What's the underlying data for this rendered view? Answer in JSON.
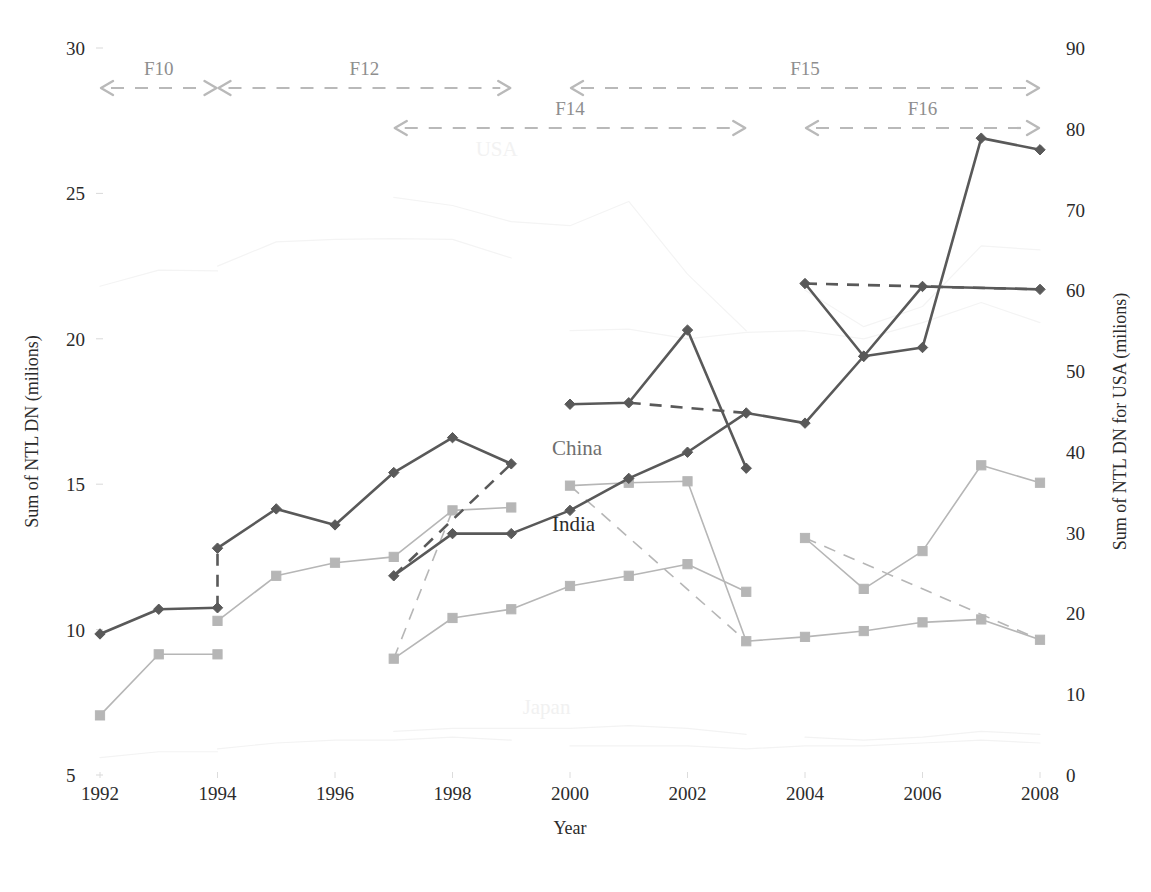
{
  "chart_data": {
    "type": "line",
    "title": "",
    "xlabel": "Year",
    "ylabel_left": "Sum of NTL DN (milions)",
    "ylabel_right": "Sum of NTL DN for USA (milions)",
    "x": [
      1992,
      1993,
      1994,
      1995,
      1996,
      1997,
      1998,
      1999,
      2000,
      2001,
      2002,
      2003,
      2004,
      2005,
      2006,
      2007,
      2008
    ],
    "xticks": [
      "1992",
      "1994",
      "1996",
      "1998",
      "2000",
      "2002",
      "2004",
      "2006",
      "2008"
    ],
    "xtick_values": [
      1992,
      1994,
      1996,
      1998,
      2000,
      2002,
      2004,
      2006,
      2008
    ],
    "ylim_left": [
      5,
      30
    ],
    "yticks_left": [
      "5",
      "10",
      "15",
      "20",
      "25",
      "30"
    ],
    "ytick_values_left": [
      5,
      10,
      15,
      20,
      25,
      30
    ],
    "ylim_right": [
      0,
      90
    ],
    "yticks_right": [
      "0",
      "10",
      "20",
      "30",
      "40",
      "50",
      "60",
      "70",
      "80",
      "90"
    ],
    "ytick_values_right": [
      0,
      10,
      20,
      30,
      40,
      50,
      60,
      70,
      80,
      90
    ],
    "grid": false,
    "legend_position": "inline-annotations",
    "satellite_annotations": [
      {
        "label": "F10",
        "x_start": 1992,
        "x_end": 1994,
        "row": 0
      },
      {
        "label": "F12",
        "x_start": 1994,
        "x_end": 1999,
        "row": 0
      },
      {
        "label": "F14",
        "x_start": 1997,
        "x_end": 2003,
        "row": 1
      },
      {
        "label": "F15",
        "x_start": 2000,
        "x_end": 2008,
        "row": 0
      },
      {
        "label": "F16",
        "x_start": 2004,
        "x_end": 2008,
        "row": 1
      }
    ],
    "inline_labels": [
      {
        "text": "China",
        "x": 2000,
        "y_left": 16.0,
        "style": "china"
      },
      {
        "text": "India",
        "x": 2000,
        "y_left": 13.4,
        "style": "india"
      },
      {
        "text": "USA",
        "x": 1998.7,
        "y_left": 26.3,
        "style": "usa"
      },
      {
        "text": "Japan",
        "x": 1999.5,
        "y_left": 7.1,
        "style": "japan"
      }
    ],
    "series": [
      {
        "name": "China",
        "axis": "left",
        "color": "#595959",
        "marker": "diamond",
        "segments": [
          {
            "satellite": "F10",
            "points": [
              {
                "x": 1992,
                "y": 9.85
              },
              {
                "x": 1993,
                "y": 10.7
              },
              {
                "x": 1994,
                "y": 10.75
              }
            ]
          },
          {
            "satellite": "F12",
            "points": [
              {
                "x": 1994,
                "y": 12.8
              },
              {
                "x": 1995,
                "y": 14.15
              },
              {
                "x": 1996,
                "y": 13.6
              },
              {
                "x": 1997,
                "y": 15.4
              },
              {
                "x": 1998,
                "y": 16.6
              },
              {
                "x": 1999,
                "y": 15.7
              }
            ]
          },
          {
            "satellite": "F14",
            "points": [
              {
                "x": 2000,
                "y": 17.75
              },
              {
                "x": 2001,
                "y": 17.8
              },
              {
                "x": 2002,
                "y": 20.3
              },
              {
                "x": 2003,
                "y": 15.55
              }
            ]
          },
          {
            "satellite": "F15",
            "points": [
              {
                "x": 2000,
                "y": 14.1
              },
              {
                "x": 2001,
                "y": 15.2
              },
              {
                "x": 2002,
                "y": 16.1
              },
              {
                "x": 2003,
                "y": 17.45
              },
              {
                "x": 2004,
                "y": 17.1
              },
              {
                "x": 2005,
                "y": 19.4
              },
              {
                "x": 2006,
                "y": 19.7
              },
              {
                "x": 2007,
                "y": 26.9
              },
              {
                "x": 2008,
                "y": 26.5
              }
            ]
          },
          {
            "satellite": "F16",
            "points": [
              {
                "x": 2004,
                "y": 21.9
              },
              {
                "x": 2005,
                "y": 19.4
              },
              {
                "x": 2006,
                "y": 21.8
              },
              {
                "x": 2008,
                "y": 21.7
              }
            ]
          }
        ],
        "dashed_connectors": [
          {
            "from": {
              "x": 1994,
              "y": 10.75
            },
            "to": {
              "x": 1994,
              "y": 12.8
            }
          },
          {
            "from": {
              "x": 1997,
              "y": 11.85
            },
            "to": {
              "x": 1999,
              "y": 15.7
            }
          },
          {
            "from": {
              "x": 2001,
              "y": 17.8
            },
            "to": {
              "x": 2003,
              "y": 17.45
            }
          },
          {
            "from": {
              "x": 2004,
              "y": 21.9
            },
            "to": {
              "x": 2008,
              "y": 21.7
            }
          }
        ],
        "extra_points": [
          {
            "x": 1997,
            "y": 11.85
          },
          {
            "x": 1998,
            "y": 13.3
          },
          {
            "x": 1999,
            "y": 13.3
          }
        ]
      },
      {
        "name": "India",
        "axis": "left",
        "color": "#b6b6b6",
        "marker": "square",
        "segments": [
          {
            "satellite": "F10",
            "points": [
              {
                "x": 1992,
                "y": 7.05
              },
              {
                "x": 1993,
                "y": 9.15
              },
              {
                "x": 1994,
                "y": 9.15
              }
            ]
          },
          {
            "satellite": "F12",
            "points": [
              {
                "x": 1994,
                "y": 10.3
              },
              {
                "x": 1995,
                "y": 11.85
              },
              {
                "x": 1996,
                "y": 12.3
              },
              {
                "x": 1997,
                "y": 12.5
              },
              {
                "x": 1998,
                "y": 14.1
              },
              {
                "x": 1999,
                "y": 14.2
              }
            ]
          },
          {
            "satellite": "F14",
            "points": [
              {
                "x": 1997,
                "y": 9.0
              },
              {
                "x": 1998,
                "y": 10.4
              },
              {
                "x": 1999,
                "y": 10.7
              },
              {
                "x": 2000,
                "y": 11.5
              },
              {
                "x": 2001,
                "y": 11.85
              },
              {
                "x": 2002,
                "y": 12.25
              },
              {
                "x": 2003,
                "y": 11.3
              }
            ]
          },
          {
            "satellite": "F15",
            "points": [
              {
                "x": 2000,
                "y": 14.95
              },
              {
                "x": 2001,
                "y": 15.05
              },
              {
                "x": 2002,
                "y": 15.1
              },
              {
                "x": 2003,
                "y": 9.6
              },
              {
                "x": 2004,
                "y": 9.75
              },
              {
                "x": 2005,
                "y": 9.95
              },
              {
                "x": 2006,
                "y": 10.25
              },
              {
                "x": 2007,
                "y": 10.35
              },
              {
                "x": 2008,
                "y": 9.65
              }
            ]
          },
          {
            "satellite": "F16",
            "points": [
              {
                "x": 2004,
                "y": 13.15
              },
              {
                "x": 2005,
                "y": 11.4
              },
              {
                "x": 2006,
                "y": 12.7
              },
              {
                "x": 2007,
                "y": 15.65
              },
              {
                "x": 2008,
                "y": 15.05
              }
            ]
          }
        ],
        "dashed_connectors": [
          {
            "from": {
              "x": 1997,
              "y": 9.0
            },
            "to": {
              "x": 1998,
              "y": 14.1
            }
          },
          {
            "from": {
              "x": 2000,
              "y": 14.95
            },
            "to": {
              "x": 2003,
              "y": 9.6
            }
          },
          {
            "from": {
              "x": 2004,
              "y": 13.15
            },
            "to": {
              "x": 2008,
              "y": 9.65
            }
          }
        ],
        "extra_points": []
      },
      {
        "name": "USA",
        "axis": "right",
        "color": "#f4f4f4",
        "marker": "none",
        "segments": [
          {
            "satellite": "F10",
            "points": [
              {
                "x": 1992,
                "y": 60.5
              },
              {
                "x": 1993,
                "y": 62.5
              },
              {
                "x": 1994,
                "y": 62.4
              }
            ]
          },
          {
            "satellite": "F12",
            "points": [
              {
                "x": 1994,
                "y": 63.0
              },
              {
                "x": 1995,
                "y": 66.0
              },
              {
                "x": 1996,
                "y": 66.3
              },
              {
                "x": 1997,
                "y": 66.4
              },
              {
                "x": 1998,
                "y": 66.3
              },
              {
                "x": 1999,
                "y": 64.0
              }
            ]
          },
          {
            "satellite": "F14",
            "points": [
              {
                "x": 1997,
                "y": 71.5
              },
              {
                "x": 1998,
                "y": 70.5
              },
              {
                "x": 1999,
                "y": 68.5
              },
              {
                "x": 2000,
                "y": 68.0
              },
              {
                "x": 2001,
                "y": 71.0
              },
              {
                "x": 2002,
                "y": 62.0
              },
              {
                "x": 2003,
                "y": 55.0
              }
            ]
          },
          {
            "satellite": "F15",
            "points": [
              {
                "x": 2000,
                "y": 55.0
              },
              {
                "x": 2001,
                "y": 55.2
              },
              {
                "x": 2002,
                "y": 54.0
              },
              {
                "x": 2003,
                "y": 54.8
              },
              {
                "x": 2004,
                "y": 55.0
              },
              {
                "x": 2005,
                "y": 54.0
              },
              {
                "x": 2006,
                "y": 56.0
              },
              {
                "x": 2007,
                "y": 58.5
              },
              {
                "x": 2008,
                "y": 56.0
              }
            ]
          },
          {
            "satellite": "F16",
            "points": [
              {
                "x": 2004,
                "y": 60.0
              },
              {
                "x": 2005,
                "y": 55.5
              },
              {
                "x": 2006,
                "y": 58.0
              },
              {
                "x": 2007,
                "y": 65.5
              },
              {
                "x": 2008,
                "y": 65.0
              }
            ]
          }
        ],
        "dashed_connectors": [],
        "extra_points": []
      },
      {
        "name": "Japan",
        "axis": "left",
        "color": "#f3f3f3",
        "marker": "none",
        "segments": [
          {
            "satellite": "F10",
            "points": [
              {
                "x": 1992,
                "y": 5.6
              },
              {
                "x": 1993,
                "y": 5.8
              },
              {
                "x": 1994,
                "y": 5.8
              }
            ]
          },
          {
            "satellite": "F12",
            "points": [
              {
                "x": 1994,
                "y": 5.9
              },
              {
                "x": 1995,
                "y": 6.1
              },
              {
                "x": 1996,
                "y": 6.2
              },
              {
                "x": 1997,
                "y": 6.2
              },
              {
                "x": 1998,
                "y": 6.3
              },
              {
                "x": 1999,
                "y": 6.2
              }
            ]
          },
          {
            "satellite": "F14",
            "points": [
              {
                "x": 1997,
                "y": 6.5
              },
              {
                "x": 1998,
                "y": 6.6
              },
              {
                "x": 1999,
                "y": 6.6
              },
              {
                "x": 2000,
                "y": 6.6
              },
              {
                "x": 2001,
                "y": 6.7
              },
              {
                "x": 2002,
                "y": 6.6
              },
              {
                "x": 2003,
                "y": 6.4
              }
            ]
          },
          {
            "satellite": "F15",
            "points": [
              {
                "x": 2000,
                "y": 6.0
              },
              {
                "x": 2001,
                "y": 6.0
              },
              {
                "x": 2002,
                "y": 6.0
              },
              {
                "x": 2003,
                "y": 5.9
              },
              {
                "x": 2004,
                "y": 6.0
              },
              {
                "x": 2005,
                "y": 6.0
              },
              {
                "x": 2006,
                "y": 6.1
              },
              {
                "x": 2007,
                "y": 6.2
              },
              {
                "x": 2008,
                "y": 6.1
              }
            ]
          },
          {
            "satellite": "F16",
            "points": [
              {
                "x": 2004,
                "y": 6.3
              },
              {
                "x": 2005,
                "y": 6.2
              },
              {
                "x": 2006,
                "y": 6.3
              },
              {
                "x": 2007,
                "y": 6.5
              },
              {
                "x": 2008,
                "y": 6.4
              }
            ]
          }
        ],
        "dashed_connectors": [],
        "extra_points": []
      }
    ]
  }
}
